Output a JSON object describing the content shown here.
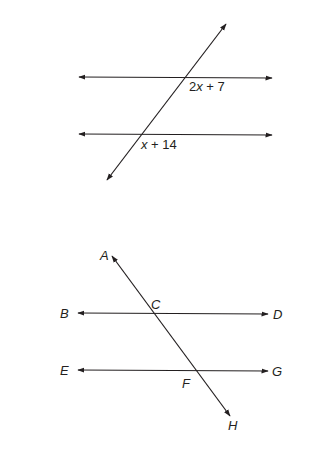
{
  "figure1": {
    "angle_label_upper": {
      "pre": "2",
      "var": "x",
      "post": " + 7"
    },
    "angle_label_lower": {
      "var": "x",
      "post": " + 14"
    }
  },
  "figure2": {
    "points": {
      "A": "A",
      "B": "B",
      "C": "C",
      "D": "D",
      "E": "E",
      "F": "F",
      "G": "G",
      "H": "H"
    }
  },
  "colors": {
    "line": "#231f20",
    "background": "#ffffff"
  }
}
